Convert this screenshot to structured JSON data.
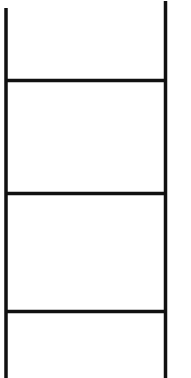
{
  "figure": {
    "icon": "ladder-icon",
    "stroke_color": "#111111",
    "background_color": "#ffffff",
    "rails": [
      {
        "name": "left-rail",
        "x": 6,
        "y1": 8,
        "y2": 378
      },
      {
        "name": "right-rail",
        "x": 165.5,
        "y1": 1,
        "y2": 378
      }
    ],
    "rungs": [
      {
        "name": "rung-1",
        "y": 80.5,
        "x1": 6,
        "x2": 165.5
      },
      {
        "name": "rung-2",
        "y": 193.5,
        "x1": 6,
        "x2": 165.5
      },
      {
        "name": "rung-3",
        "y": 311.5,
        "x1": 6,
        "x2": 165.5
      }
    ]
  }
}
